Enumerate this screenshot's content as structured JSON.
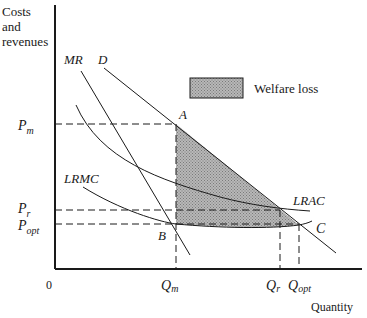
{
  "diagram": {
    "axes": {
      "y_label_lines": [
        "Costs",
        "and",
        "revenues"
      ],
      "x_label": "Quantity",
      "origin": "0"
    },
    "curves": {
      "mr": "MR",
      "d": "D",
      "lrmc": "LRMC",
      "lrac": "LRAC"
    },
    "points": {
      "a": "A",
      "b": "B",
      "c": "C"
    },
    "price_levels": {
      "pm": {
        "base": "P",
        "sub": "m"
      },
      "pr": {
        "base": "P",
        "sub": "r"
      },
      "popt": {
        "base": "P",
        "sub": "opt"
      }
    },
    "quantity_levels": {
      "qm": {
        "base": "Q",
        "sub": "m"
      },
      "qr": {
        "base": "Q",
        "sub": "r"
      },
      "qopt": {
        "base": "Q",
        "sub": "opt"
      }
    },
    "legend": {
      "label": "Welfare loss"
    },
    "colors": {
      "line": "#1a1a1a",
      "shade": "#a6a6a6"
    }
  }
}
